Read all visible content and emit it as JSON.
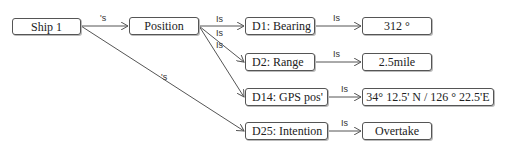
{
  "diagram": {
    "nodes": {
      "ship": "Ship 1",
      "position": "Position",
      "d1": "D1: Bearing",
      "d2": "D2: Range",
      "d14": "D14: GPS pos'",
      "d25": "D25: Intention",
      "v1": "312 °",
      "v2": "2.5mile",
      "v14": "34° 12.5' N / 126 °  22.5'E",
      "v25": "Overtake"
    },
    "edge_labels": {
      "ship_position": "'s",
      "ship_d25": "'s",
      "pos_d1": "Is",
      "pos_d2": "Is",
      "pos_d14": "Is",
      "d1_v1": "Is",
      "d2_v2": "Is",
      "d14_v14": "Is",
      "d25_v25": "Is"
    },
    "colors": {
      "line": "#555555",
      "text": "#222222"
    }
  }
}
